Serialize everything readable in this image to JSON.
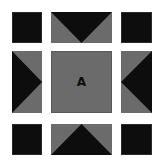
{
  "board": {
    "background": "#ffffff",
    "colors": {
      "dark": "#0d0d0d",
      "gray": "#6b6b6b"
    },
    "center": {
      "label": "A"
    },
    "corners": {
      "top_left": {
        "glyph": ""
      },
      "top_right": {
        "glyph": ""
      },
      "bottom_left": {
        "glyph": ""
      },
      "bottom_right": {
        "glyph": ""
      }
    },
    "edges": {
      "top": {
        "arrow": "down"
      },
      "bottom": {
        "arrow": "up"
      },
      "left": {
        "arrow": "right"
      },
      "right": {
        "arrow": "left"
      }
    }
  }
}
